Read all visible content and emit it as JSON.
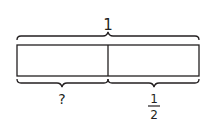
{
  "diagram": {
    "type": "tape-diagram",
    "whole_label": "1",
    "parts": [
      {
        "label": "?",
        "kind": "unknown"
      },
      {
        "label_numerator": "1",
        "label_denominator": "2",
        "kind": "fraction"
      }
    ],
    "colors": {
      "stroke": "#231f20",
      "background": "#ffffff"
    }
  }
}
